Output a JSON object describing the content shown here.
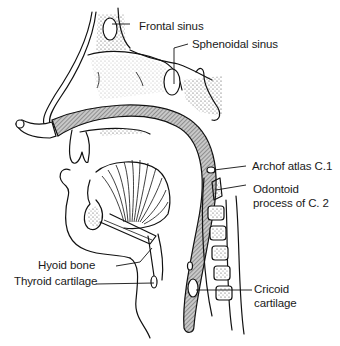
{
  "figure": {
    "labels": {
      "frontal_sinus": "Frontal sinus",
      "sphenoidal_sinus": "Sphenoidal sinus",
      "arch_of_atlas": "Archof atlas C.1",
      "odontoid_line1": "Odontoid",
      "odontoid_line2": "process of C. 2",
      "hyoid_bone": "Hyoid bone",
      "thyroid_cartilage": "Thyroid cartilage",
      "cricoid_line1": "Cricoid",
      "cricoid_line2": "cartilage"
    },
    "colors": {
      "ink": "#111111",
      "background": "#ffffff",
      "hatch_fill": "#9a9a9a"
    }
  }
}
